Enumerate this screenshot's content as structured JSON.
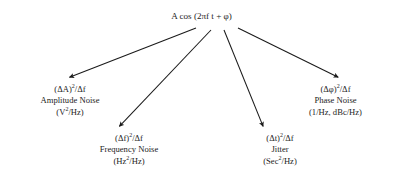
{
  "diagram": {
    "background_color": "#ffffff",
    "text_color": "#1c1c1c",
    "arrow_color": "#1a1a1a",
    "source": {
      "label": "A cos (2πf t + φ)",
      "lines": [
        "A cos (2πf t + φ)"
      ]
    },
    "branches": [
      {
        "id": "amplitude-noise",
        "expression": "(ΔA)",
        "expression_sup": "2",
        "expression_tail": "/Δf",
        "name": "Amplitude Noise",
        "units_pre": "(V",
        "units_sup": "2",
        "units_tail": "/Hz)"
      },
      {
        "id": "frequency-noise",
        "expression": "(Δf)",
        "expression_sup": "2",
        "expression_tail": "/Δf",
        "name": "Frequency Noise",
        "units_pre": "(Hz",
        "units_sup": "2",
        "units_tail": "/Hz)"
      },
      {
        "id": "jitter",
        "expression": "(Δt)",
        "expression_sup": "2",
        "expression_tail": "/Δf",
        "name": "Jitter",
        "units_pre": "(Sec",
        "units_sup": "2",
        "units_tail": "/Hz)"
      },
      {
        "id": "phase-noise",
        "expression": "(Δφ)",
        "expression_sup": "2",
        "expression_tail": "/Δf",
        "name": "Phase Noise",
        "units_pre": "(1/Hz, dBc/Hz)",
        "units_sup": "",
        "units_tail": ""
      }
    ],
    "arrows": [
      {
        "id": "arrow-to-amplitude",
        "from_x": 196,
        "from_y": 28,
        "to_x": 68,
        "to_y": 78
      },
      {
        "id": "arrow-to-frequency",
        "from_x": 211,
        "from_y": 30,
        "to_x": 118,
        "to_y": 128
      },
      {
        "id": "arrow-to-jitter",
        "from_x": 224,
        "from_y": 30,
        "to_x": 264,
        "to_y": 128
      },
      {
        "id": "arrow-to-phase",
        "from_x": 238,
        "from_y": 28,
        "to_x": 340,
        "to_y": 78
      }
    ]
  }
}
